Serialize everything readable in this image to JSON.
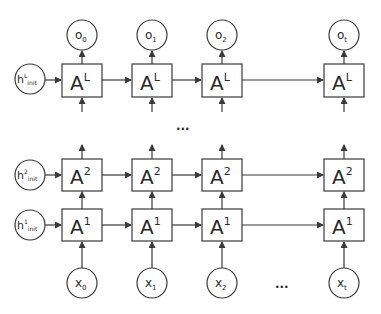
{
  "diagram": {
    "layers": [
      {
        "id": "L",
        "cell_base": "A",
        "cell_sup": "L",
        "init_base": "h",
        "init_sup": "L",
        "init_sub": "init"
      },
      {
        "id": "2",
        "cell_base": "A",
        "cell_sup": "2",
        "init_base": "h",
        "init_sup": "2",
        "init_sub": "init"
      },
      {
        "id": "1",
        "cell_base": "A",
        "cell_sup": "1",
        "init_base": "h",
        "init_sup": "1",
        "init_sub": "init"
      }
    ],
    "outputs": [
      {
        "base": "o",
        "sub": "0"
      },
      {
        "base": "o",
        "sub": "1"
      },
      {
        "base": "o",
        "sub": "2"
      },
      {
        "base": "o",
        "sub": "t"
      }
    ],
    "inputs": [
      {
        "base": "x",
        "sub": "0"
      },
      {
        "base": "x",
        "sub": "1"
      },
      {
        "base": "x",
        "sub": "2"
      },
      {
        "base": "x",
        "sub": "t"
      }
    ],
    "ellipsis_layers": "...",
    "ellipsis_time": "...",
    "colors": {
      "stroke": "#3a3a3a",
      "text": "#2a2a2a",
      "background": "#ffffff"
    }
  }
}
